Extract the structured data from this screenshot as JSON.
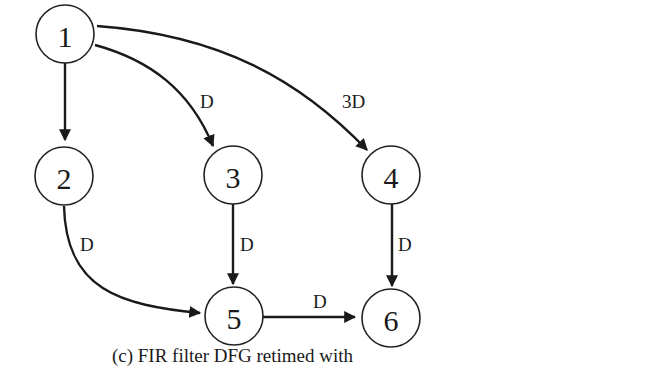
{
  "diagram": {
    "caption": "(c) FIR filter DFG retimed with",
    "nodes": [
      {
        "id": "1",
        "label": "1"
      },
      {
        "id": "2",
        "label": "2"
      },
      {
        "id": "3",
        "label": "3"
      },
      {
        "id": "4",
        "label": "4"
      },
      {
        "id": "5",
        "label": "5"
      },
      {
        "id": "6",
        "label": "6"
      }
    ],
    "edges": [
      {
        "from": "1",
        "to": "2",
        "label": ""
      },
      {
        "from": "1",
        "to": "3",
        "label": "D"
      },
      {
        "from": "1",
        "to": "4",
        "label": "3D"
      },
      {
        "from": "2",
        "to": "5",
        "label": "D"
      },
      {
        "from": "3",
        "to": "5",
        "label": "D"
      },
      {
        "from": "4",
        "to": "6",
        "label": "D"
      },
      {
        "from": "5",
        "to": "6",
        "label": "D"
      }
    ]
  }
}
